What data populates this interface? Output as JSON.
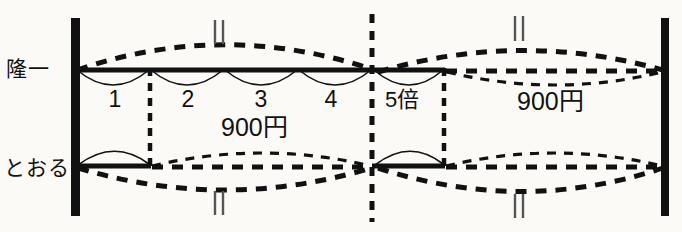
{
  "figure": {
    "type": "tape-diagram",
    "background_color": "#fbfaf7",
    "ink_color": "#111111",
    "persons": [
      {
        "id": "ryuichi",
        "label": "隆一",
        "row": "top"
      },
      {
        "id": "tooru",
        "label": "とおる",
        "row": "bottom"
      }
    ],
    "segment_numbers": [
      "1",
      "2",
      "3",
      "4"
    ],
    "multiplier_label": "5倍",
    "price_labels": [
      {
        "id": "price-left",
        "text": "900円"
      },
      {
        "id": "price-right",
        "text": "900円"
      }
    ],
    "tick_marks": [
      {
        "id": "tick-top-left",
        "x": 219,
        "y": 30
      },
      {
        "id": "tick-top-right",
        "x": 519,
        "y": 27
      },
      {
        "id": "tick-bottom-left",
        "x": 219,
        "y": 202
      },
      {
        "id": "tick-bottom-right",
        "x": 519,
        "y": 205
      }
    ],
    "vertical_bars": [
      {
        "id": "bar-left",
        "x": 75,
        "y1": 18,
        "y2": 216
      },
      {
        "id": "bar-right",
        "x": 665,
        "y1": 18,
        "y2": 216
      }
    ],
    "dashed_divider": {
      "id": "center-divider",
      "x": 372,
      "y1": 14,
      "y2": 222
    },
    "dashed_drop_lines": [
      {
        "id": "drop-left",
        "x": 150,
        "y1": 70,
        "y2": 166
      },
      {
        "id": "drop-right",
        "x": 444,
        "y1": 70,
        "y2": 166
      }
    ],
    "rows": [
      {
        "id": "row-top",
        "axis_y": 70,
        "solid_span": [
          75,
          444
        ],
        "arcs_down_solid": 5,
        "arc_dashed_over_span": [
          75,
          372
        ],
        "lens_dashed_span": [
          444,
          665
        ]
      },
      {
        "id": "row-bottom",
        "axis_y": 166,
        "solid_spans": [
          [
            75,
            150
          ],
          [
            372,
            444
          ]
        ],
        "arcs_up_solid": 2,
        "lens_dashed_spans": [
          [
            150,
            372
          ],
          [
            444,
            665
          ]
        ]
      }
    ]
  }
}
